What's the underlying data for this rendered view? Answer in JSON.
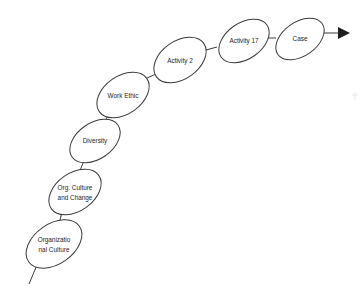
{
  "diagram": {
    "type": "flow-chain",
    "background_color": "#ffffff",
    "stroke_color": "#3a3a3a",
    "text_color": "#1e1e1e",
    "direction": "bottom-left to top-right",
    "nodes": [
      {
        "id": "organizational-culture",
        "label_line1": "Organizatio",
        "label_line2": "nal Culture",
        "full_label": "Organizational Culture",
        "cx": 54,
        "cy": 244,
        "rx": 31,
        "ry": 20,
        "rotation": -35
      },
      {
        "id": "org-culture-and-change",
        "label_line1": "Org. Culture",
        "label_line2": "and Change",
        "full_label": "Org. Culture and Change",
        "cx": 75,
        "cy": 192,
        "rx": 29,
        "ry": 19,
        "rotation": -35
      },
      {
        "id": "diversity",
        "label_line1": "Diversity",
        "label_line2": "",
        "full_label": "Diversity",
        "cx": 95,
        "cy": 141,
        "rx": 28,
        "ry": 18,
        "rotation": -35
      },
      {
        "id": "work-ethic",
        "label_line1": "Work Ethic",
        "label_line2": "",
        "full_label": "Work Ethic",
        "cx": 123,
        "cy": 95,
        "rx": 29,
        "ry": 19,
        "rotation": -35
      },
      {
        "id": "activity-2",
        "label_line1": "Activity 2",
        "label_line2": "",
        "full_label": "Activity 2",
        "cx": 180,
        "cy": 60,
        "rx": 29,
        "ry": 19,
        "rotation": -35
      },
      {
        "id": "activity-17",
        "label_line1": "Activity 17",
        "label_line2": "",
        "full_label": "Activity 17",
        "cx": 244,
        "cy": 41,
        "rx": 28,
        "ry": 18,
        "rotation": -35
      },
      {
        "id": "case",
        "label_line1": "Case",
        "label_line2": "",
        "full_label": "Case",
        "cx": 300,
        "cy": 39,
        "rx": 27,
        "ry": 17,
        "rotation": -35
      }
    ],
    "connectors": [
      {
        "id": "connector-organizational-culture-to-org-culture-and-change",
        "x1": 59,
        "y1": 224,
        "x2": 62,
        "y2": 212
      },
      {
        "id": "connector-org-culture-and-change-to-diversity",
        "x1": 79,
        "y1": 173,
        "x2": 83,
        "y2": 163
      },
      {
        "id": "connector-diversity-to-work-ethic",
        "x1": 104,
        "y1": 122,
        "x2": 110,
        "y2": 113
      },
      {
        "id": "connector-work-ethic-to-activity-2",
        "x1": 147,
        "y1": 78,
        "x2": 155,
        "y2": 74
      },
      {
        "id": "connector-activity-2-to-activity-17",
        "x1": 206,
        "y1": 50,
        "x2": 217,
        "y2": 47
      },
      {
        "id": "connector-activity-17-to-case",
        "x1": 268,
        "y1": 38,
        "x2": 276,
        "y2": 38
      }
    ],
    "tail": {
      "id": "entry-tail",
      "x1": 37,
      "y1": 265,
      "x2": 29,
      "y2": 284
    },
    "arrow": {
      "id": "exit-arrow",
      "line_x1": 324,
      "line_y1": 33,
      "line_x2": 338,
      "line_y2": 33,
      "head_points": "338,27 350,33 338,39",
      "direction": "right"
    }
  }
}
